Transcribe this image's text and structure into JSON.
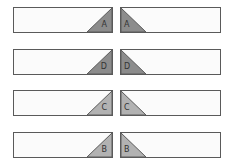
{
  "diagram": {
    "rows": [
      {
        "label": "A",
        "fill": "#8c8c8c",
        "top": 7
      },
      {
        "label": "D",
        "fill": "#8c8c8c",
        "top": 49
      },
      {
        "label": "C",
        "fill": "#b2b2b2",
        "top": 90
      },
      {
        "label": "B",
        "fill": "#b2b2b2",
        "top": 132
      }
    ],
    "stroke": "#5a5a5a",
    "strip_fill": "#fbfbfb"
  }
}
